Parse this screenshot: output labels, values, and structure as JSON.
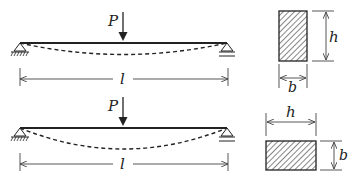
{
  "figure": {
    "colors": {
      "line": "#222222",
      "dim": "#444444",
      "background": "#ffffff"
    }
  },
  "beams": [
    {
      "id": "top",
      "load_label": "P",
      "span_label": "l",
      "section": {
        "orientation": "upright",
        "height_label": "h",
        "width_label": "b"
      }
    },
    {
      "id": "bottom",
      "load_label": "P",
      "span_label": "l",
      "section": {
        "orientation": "flat",
        "height_label": "h",
        "width_label": "b"
      }
    }
  ]
}
